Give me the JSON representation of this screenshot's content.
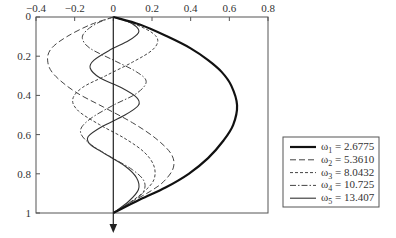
{
  "chart_data": {
    "type": "line",
    "title": "",
    "xlabel": "",
    "ylabel": "",
    "xlim": [
      -0.4,
      0.8
    ],
    "ylim": [
      0,
      1
    ],
    "y_inverted": true,
    "grid": false,
    "legend_position": "right",
    "x_ticks": [
      "-0.4",
      "-0.2",
      "0",
      "0.2",
      "0.4",
      "0.6",
      "0.8"
    ],
    "y_ticks": [
      "0",
      "0.2",
      "0.4",
      "0.6",
      "0.8",
      "1"
    ],
    "annotations": [
      "downward arrow along x = 0 axis"
    ],
    "series": [
      {
        "name": "ω1 = 2.6775",
        "label_main": "ω",
        "label_sub": "1",
        "label_value": " = 2.6775",
        "style": "thick-solid",
        "points": [
          [
            0,
            0
          ],
          [
            0.14,
            0.04
          ],
          [
            0.28,
            0.1
          ],
          [
            0.4,
            0.16
          ],
          [
            0.49,
            0.22
          ],
          [
            0.56,
            0.28
          ],
          [
            0.61,
            0.35
          ],
          [
            0.64,
            0.45
          ],
          [
            0.62,
            0.55
          ],
          [
            0.57,
            0.63
          ],
          [
            0.49,
            0.72
          ],
          [
            0.39,
            0.8
          ],
          [
            0.27,
            0.87
          ],
          [
            0.14,
            0.93
          ],
          [
            0,
            1
          ]
        ]
      },
      {
        "name": "ω2 = 5.3610",
        "label_main": "ω",
        "label_sub": "2",
        "label_value": " = 5.3610",
        "style": "long-dash",
        "points": [
          [
            0,
            0
          ],
          [
            -0.12,
            0.04
          ],
          [
            -0.24,
            0.1
          ],
          [
            -0.32,
            0.16
          ],
          [
            -0.34,
            0.22
          ],
          [
            -0.31,
            0.29
          ],
          [
            -0.2,
            0.38
          ],
          [
            -0.05,
            0.46
          ],
          [
            0.1,
            0.54
          ],
          [
            0.22,
            0.62
          ],
          [
            0.3,
            0.7
          ],
          [
            0.31,
            0.77
          ],
          [
            0.26,
            0.84
          ],
          [
            0.19,
            0.89
          ],
          [
            0.1,
            0.94
          ],
          [
            0,
            1
          ]
        ]
      },
      {
        "name": "ω3 = 8.0432",
        "label_main": "ω",
        "label_sub": "3",
        "label_value": " = 8.0432",
        "style": "short-dash",
        "points": [
          [
            0,
            0
          ],
          [
            0.12,
            0.04
          ],
          [
            0.2,
            0.08
          ],
          [
            0.23,
            0.12
          ],
          [
            0.2,
            0.17
          ],
          [
            0.1,
            0.23
          ],
          [
            -0.04,
            0.3
          ],
          [
            -0.16,
            0.36
          ],
          [
            -0.21,
            0.42
          ],
          [
            -0.18,
            0.48
          ],
          [
            -0.07,
            0.55
          ],
          [
            0.06,
            0.62
          ],
          [
            0.16,
            0.69
          ],
          [
            0.21,
            0.76
          ],
          [
            0.21,
            0.83
          ],
          [
            0.16,
            0.89
          ],
          [
            0.08,
            0.95
          ],
          [
            0,
            1
          ]
        ]
      },
      {
        "name": "ω4 = 10.725",
        "label_main": "ω",
        "label_sub": "4",
        "label_value": " = 10.725",
        "style": "dash-dot",
        "points": [
          [
            0,
            0
          ],
          [
            -0.08,
            0.03
          ],
          [
            -0.14,
            0.07
          ],
          [
            -0.16,
            0.11
          ],
          [
            -0.12,
            0.16
          ],
          [
            0.0,
            0.22
          ],
          [
            0.12,
            0.28
          ],
          [
            0.17,
            0.33
          ],
          [
            0.12,
            0.39
          ],
          [
            0.0,
            0.45
          ],
          [
            -0.12,
            0.52
          ],
          [
            -0.17,
            0.58
          ],
          [
            -0.13,
            0.64
          ],
          [
            -0.02,
            0.71
          ],
          [
            0.1,
            0.78
          ],
          [
            0.16,
            0.84
          ],
          [
            0.15,
            0.9
          ],
          [
            0.08,
            0.95
          ],
          [
            0,
            1
          ]
        ]
      },
      {
        "name": "ω5 = 13.407",
        "label_main": "ω",
        "label_sub": "5",
        "label_value": " = 13.407",
        "style": "thin-solid",
        "points": [
          [
            0,
            0
          ],
          [
            0.07,
            0.02
          ],
          [
            0.12,
            0.05
          ],
          [
            0.13,
            0.08
          ],
          [
            0.08,
            0.12
          ],
          [
            -0.02,
            0.17
          ],
          [
            -0.1,
            0.22
          ],
          [
            -0.12,
            0.26
          ],
          [
            -0.07,
            0.31
          ],
          [
            0.04,
            0.36
          ],
          [
            0.12,
            0.41
          ],
          [
            0.13,
            0.45
          ],
          [
            0.06,
            0.5
          ],
          [
            -0.06,
            0.56
          ],
          [
            -0.13,
            0.61
          ],
          [
            -0.12,
            0.65
          ],
          [
            -0.04,
            0.7
          ],
          [
            0.06,
            0.76
          ],
          [
            0.12,
            0.82
          ],
          [
            0.13,
            0.88
          ],
          [
            0.08,
            0.94
          ],
          [
            0,
            1
          ]
        ]
      }
    ]
  }
}
